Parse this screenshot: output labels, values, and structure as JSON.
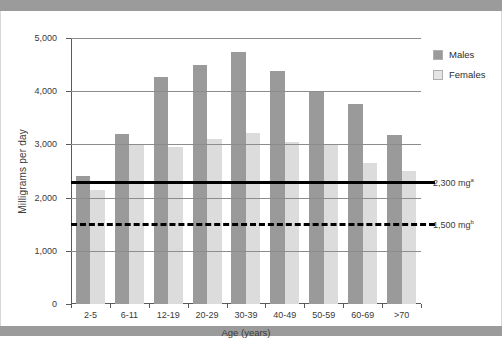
{
  "figure": {
    "y_axis_title": "Milligrams per day",
    "x_axis_title": "Age (years)",
    "y_ticks": [
      "0",
      "1,000",
      "2,000",
      "3,000",
      "4,000",
      "5,000"
    ],
    "legend": [
      {
        "label": "Males",
        "color": "#9a9a9a"
      },
      {
        "label": "Females",
        "color": "#e4e4e4"
      }
    ],
    "reference_notes": [
      {
        "value": "2,300 mg",
        "superscript": "a"
      },
      {
        "value": "1,500 mg",
        "superscript": "b"
      }
    ]
  },
  "chart_data": {
    "type": "bar",
    "title": "",
    "xlabel": "Age (years)",
    "ylabel": "Milligrams per day",
    "ylim": [
      0,
      5000
    ],
    "ytick_values": [
      0,
      1000,
      2000,
      3000,
      4000,
      5000
    ],
    "grid": true,
    "legend_position": "right",
    "categories": [
      "2-5",
      "6-11",
      "12-19",
      "20-29",
      "30-39",
      "40-49",
      "50-59",
      "60-69",
      ">70"
    ],
    "series": [
      {
        "name": "Males",
        "color": "#9a9a9a",
        "values": [
          2400,
          3200,
          4270,
          4500,
          4730,
          4380,
          3980,
          3760,
          3180
        ]
      },
      {
        "name": "Females",
        "color": "#dcdcdc",
        "values": [
          2150,
          2980,
          2950,
          3110,
          3210,
          3050,
          3000,
          2650,
          2500
        ]
      }
    ],
    "reference_lines": [
      {
        "label": "2,300 mg",
        "superscript": "a",
        "value": 2300,
        "style": "solid"
      },
      {
        "label": "1,500 mg",
        "superscript": "b",
        "value": 1500,
        "style": "dashed"
      }
    ]
  }
}
